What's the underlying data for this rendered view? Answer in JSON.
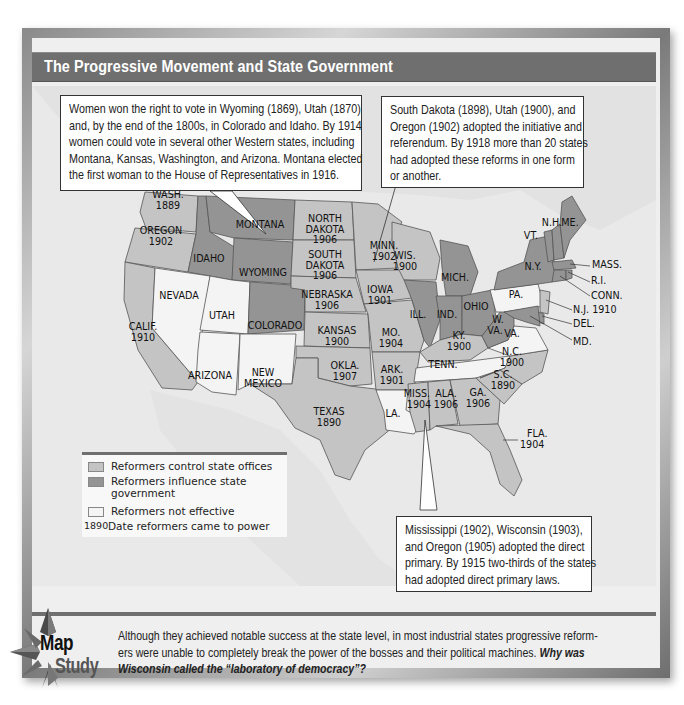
{
  "title": "The Progressive Movement and State Government",
  "colors": {
    "control": "#c4c4c4",
    "influence": "#949494",
    "not_effective": "#f4f4f4",
    "title_bar": "#6f6f6f",
    "water": "#e9e9e9"
  },
  "callouts": {
    "suffrage": [
      "Women won the right to vote in Wyoming (1869), Utah (1870)",
      "and, by the end of the 1800s, in Colorado and Idaho. By 1914",
      "women could vote in several other Western states, including",
      "Montana, Kansas, Washington, and Arizona. Montana elected",
      "the first woman to the House of Representatives in 1916."
    ],
    "initiative": [
      "South Dakota (1898), Utah (1900), and",
      "Oregon (1902) adopted the initiative and",
      "referendum. By 1918 more than 20 states",
      "had adopted these reforms in one form",
      "or another."
    ],
    "primary": [
      "Mississippi (1902), Wisconsin (1903),",
      "and Oregon (1905) adopted the direct",
      "primary. By 1915 two-thirds of the states",
      "had adopted direct primary laws."
    ]
  },
  "legend": {
    "items": [
      {
        "label": "Reformers control state offices",
        "type": "control"
      },
      {
        "label": "Reformers influence state",
        "label2": "government",
        "type": "influence"
      },
      {
        "label": "Reformers not effective",
        "type": "not_effective"
      },
      {
        "year": "1890",
        "label": "Date reformers came to power"
      }
    ]
  },
  "states": {
    "wash": {
      "name": "WASH.",
      "year": "1889",
      "status": "control"
    },
    "oregon": {
      "name": "OREGON",
      "year": "1902",
      "status": "control"
    },
    "calif": {
      "name": "CALIF.",
      "year": "1910",
      "status": "control"
    },
    "idaho": {
      "name": "IDAHO",
      "status": "influence"
    },
    "nevada": {
      "name": "NEVADA",
      "status": "not_effective"
    },
    "montana": {
      "name": "MONTANA",
      "status": "influence"
    },
    "wyoming": {
      "name": "WYOMING",
      "status": "influence"
    },
    "utah": {
      "name": "UTAH",
      "status": "not_effective"
    },
    "colorado": {
      "name": "COLORADO",
      "status": "influence"
    },
    "arizona": {
      "name": "ARIZONA",
      "status": "not_effective"
    },
    "newmexico": {
      "name": "NEW",
      "name2": "MEXICO",
      "status": "not_effective"
    },
    "ndakota": {
      "name": "NORTH",
      "name2": "DAKOTA",
      "year": "1906",
      "status": "control"
    },
    "sdakota": {
      "name": "SOUTH",
      "name2": "DAKOTA",
      "year": "1906",
      "status": "control"
    },
    "nebraska": {
      "name": "NEBRASKA",
      "year": "1906",
      "status": "control"
    },
    "kansas": {
      "name": "KANSAS",
      "year": "1900",
      "status": "control"
    },
    "okla": {
      "name": "OKLA.",
      "year": "1907",
      "status": "control"
    },
    "texas": {
      "name": "TEXAS",
      "year": "1890",
      "status": "control"
    },
    "minn": {
      "name": "MINN.",
      "year": "1902",
      "status": "control"
    },
    "iowa": {
      "name": "IOWA",
      "year": "1901",
      "status": "control"
    },
    "mo": {
      "name": "MO.",
      "year": "1904",
      "status": "control"
    },
    "ark": {
      "name": "ARK.",
      "year": "1901",
      "status": "control"
    },
    "la": {
      "name": "LA.",
      "status": "not_effective"
    },
    "wis": {
      "name": "WIS.",
      "year": "1900",
      "status": "control"
    },
    "ill": {
      "name": "ILL.",
      "status": "influence"
    },
    "mich": {
      "name": "MICH.",
      "status": "influence"
    },
    "ind": {
      "name": "IND.",
      "status": "influence"
    },
    "ohio": {
      "name": "OHIO",
      "status": "influence"
    },
    "ky": {
      "name": "KY.",
      "year": "1900",
      "status": "control"
    },
    "tenn": {
      "name": "TENN.",
      "status": "not_effective"
    },
    "miss": {
      "name": "MISS.",
      "year": "1904",
      "status": "control"
    },
    "ala": {
      "name": "ALA.",
      "year": "1906",
      "status": "control"
    },
    "ga": {
      "name": "GA.",
      "year": "1906",
      "status": "control"
    },
    "fla": {
      "name": "FLA.",
      "year": "1904",
      "status": "control"
    },
    "sc": {
      "name": "S.C.",
      "year": "1890",
      "status": "control"
    },
    "nc": {
      "name": "N.C.",
      "year": "1900",
      "status": "control"
    },
    "va": {
      "name": "VA.",
      "status": "not_effective"
    },
    "wva": {
      "name": "W.",
      "name2": "VA.",
      "status": "influence"
    },
    "pa": {
      "name": "PA.",
      "status": "not_effective"
    },
    "ny": {
      "name": "N.Y.",
      "status": "influence"
    },
    "vt": {
      "name": "VT.",
      "status": "influence"
    },
    "nh": {
      "name": "N.H.",
      "status": "influence"
    },
    "me": {
      "name": "ME.",
      "status": "influence"
    },
    "mass": {
      "name": "MASS.",
      "status": "influence"
    },
    "ri": {
      "name": "R.I.",
      "status": "influence"
    },
    "conn": {
      "name": "CONN.",
      "status": "influence"
    },
    "nj": {
      "name": "N.J. 1910",
      "status": "control"
    },
    "del": {
      "name": "DEL.",
      "status": "influence"
    },
    "md": {
      "name": "MD.",
      "status": "influence"
    }
  },
  "map_study": {
    "word1": "Map",
    "word2": "Study",
    "line1": "Although they achieved notable success at the state level, in most industrial states progressive reform-",
    "line2": "ers were unable to completely break the power of the bosses and their political machines. ",
    "question1": "Why was",
    "question2": "Wisconsin called the “laboratory of democracy”?"
  }
}
